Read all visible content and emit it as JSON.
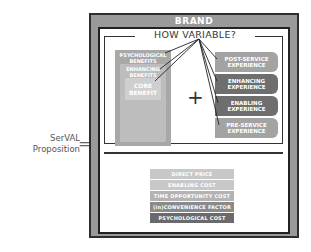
{
  "equation": {
    "label_line1": "SerVAL",
    "label_line2": "Proposition",
    "operator": "="
  },
  "brand": {
    "title": "BRAND"
  },
  "variability": {
    "question": "HOW VARIABLE?"
  },
  "benefits": {
    "outer": "PSYCHOLOGICAL BENEFITS",
    "middle": "ENHANCING BENEFITS",
    "core": "CORE BENEFIT"
  },
  "plus": "+",
  "experiences": [
    {
      "label": "POST-SERVICE EXPERIENCE",
      "color": "#a3a3a3"
    },
    {
      "label": "ENHANCING EXPERIENCE",
      "color": "#6e6e6e"
    },
    {
      "label": "ENABLING EXPERIENCE",
      "color": "#6e6e6e"
    },
    {
      "label": "PRE-SERVICE EXPERIENCE",
      "color": "#a3a3a3"
    }
  ],
  "costs": [
    {
      "label": "DIRECT PRICE",
      "color": "#c8c8c8"
    },
    {
      "label": "ENABLING COST",
      "color": "#c8c8c8"
    },
    {
      "label": "TIME OPPORTUNITY COST",
      "color": "#b3b3b3"
    },
    {
      "label": "(in)CONVENIENCE FACTOR",
      "color": "#8a8a8a"
    },
    {
      "label": "PSYCHOLOGICAL COST",
      "color": "#6a6a6a"
    }
  ]
}
